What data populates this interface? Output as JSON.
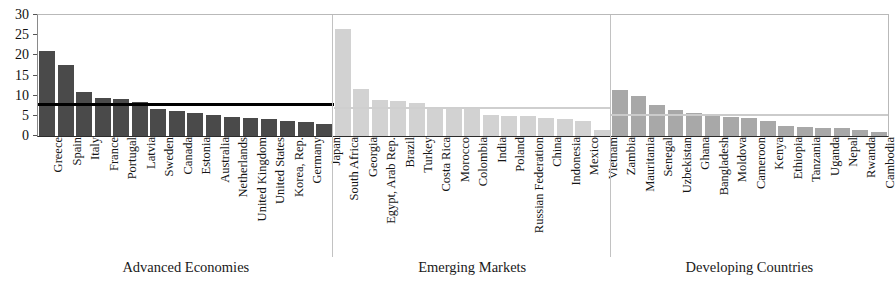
{
  "chart_data": {
    "type": "bar",
    "title": "",
    "xlabel": "",
    "ylabel": "",
    "ylim": [
      0,
      30
    ],
    "ytick_labels": [
      "0",
      "5",
      "10",
      "15",
      "20",
      "25",
      "30"
    ],
    "ytick_values": [
      0,
      5,
      10,
      15,
      20,
      25,
      30
    ],
    "grid": false,
    "legend": "none",
    "categories": [
      "Greece",
      "Spain",
      "Italy",
      "France",
      "Portugal",
      "Latvia",
      "Sweden",
      "Canada",
      "Estonia",
      "Australia",
      "Netherlands",
      "United Kingdom",
      "United States",
      "Korea, Rep.",
      "Germany",
      "Japan",
      "South Africa",
      "Georgia",
      "Egypt, Arab Rep.",
      "Brazil",
      "Turkey",
      "Costa Rica",
      "Morocco",
      "Colombia",
      "India",
      "Poland",
      "Russian Federation",
      "China",
      "Indonesia",
      "Mexico",
      "Vietnam",
      "Zambia",
      "Mauritania",
      "Senegal",
      "Uzbekistan",
      "Ghana",
      "Bangladesh",
      "Moldova",
      "Cameroon",
      "Kenya",
      "Ethiopia",
      "Tanzania",
      "Uganda",
      "Nepal",
      "Rwanda",
      "Cambodia"
    ],
    "values": [
      21.2,
      17.7,
      11.0,
      9.5,
      9.2,
      8.4,
      6.6,
      6.2,
      5.7,
      5.2,
      4.7,
      4.4,
      4.3,
      3.7,
      3.4,
      2.9,
      26.5,
      11.6,
      9.0,
      8.7,
      8.3,
      7.1,
      7.0,
      6.9,
      5.1,
      5.0,
      4.9,
      4.5,
      4.2,
      3.7,
      1.4,
      11.5,
      9.8,
      7.7,
      6.4,
      5.6,
      4.9,
      4.7,
      4.4,
      3.6,
      2.5,
      2.3,
      2.1,
      1.9,
      1.4,
      0.9
    ],
    "groups": [
      {
        "name": "Advanced Economies",
        "start_index": 0,
        "end_index": 15,
        "bar_color": "#4a4a4a",
        "average_line_value": 7.5,
        "average_line_color": "#000000"
      },
      {
        "name": "Emerging Markets",
        "start_index": 16,
        "end_index": 30,
        "bar_color": "#d2d2d2",
        "average_line_value": 6.6,
        "average_line_color": "#cfcfcf"
      },
      {
        "name": "Developing Countries",
        "start_index": 31,
        "end_index": 45,
        "bar_color": "#a8a8a8",
        "average_line_value": 5.0,
        "average_line_color": "#cbcbcb"
      }
    ]
  }
}
